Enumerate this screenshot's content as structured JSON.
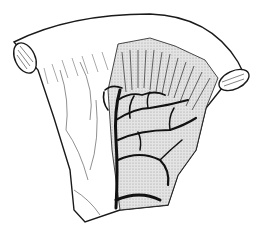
{
  "figure": {
    "kind": "scientific-illustration",
    "style": "black ink line engraving on white",
    "colors": {
      "background": "#ffffff",
      "ink": "#1a1a1a",
      "stipple": "#d6d6d6"
    }
  }
}
